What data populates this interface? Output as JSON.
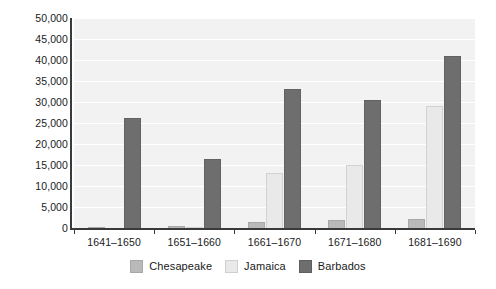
{
  "chart_data": {
    "type": "bar",
    "title": "",
    "subtitle": "",
    "xlabel": "",
    "ylabel": "",
    "categories": [
      "1641–1650",
      "1651–1660",
      "1661–1670",
      "1671–1680",
      "1681–1690"
    ],
    "series": [
      {
        "name": "Chesapeake",
        "color": "#b9b9b9",
        "values": [
          300,
          400,
          1500,
          2000,
          2100
        ]
      },
      {
        "name": "Jamaica",
        "color": "#e9e9e9",
        "values": [
          0,
          300,
          13000,
          15000,
          29000
        ]
      },
      {
        "name": "Barbados",
        "color": "#6e6e6e",
        "values": [
          26200,
          16500,
          33200,
          30500,
          41000
        ]
      }
    ],
    "ylim": [
      0,
      50000
    ],
    "yticks": [
      0,
      5000,
      10000,
      15000,
      20000,
      25000,
      30000,
      35000,
      40000,
      45000,
      50000
    ],
    "ytick_labels": [
      "0",
      "5,000",
      "10,000",
      "15,000",
      "20,000",
      "25,000",
      "30,000",
      "35,000",
      "40,000",
      "45,000",
      "50,000"
    ],
    "grid": true,
    "grid_color": "#ffffff",
    "plot_background": "#f2f2f2",
    "legend_position": "bottom",
    "axis_color": "#3a3a3a"
  },
  "legend": {
    "items": [
      {
        "label": "Chesapeake"
      },
      {
        "label": "Jamaica"
      },
      {
        "label": "Barbados"
      }
    ]
  }
}
